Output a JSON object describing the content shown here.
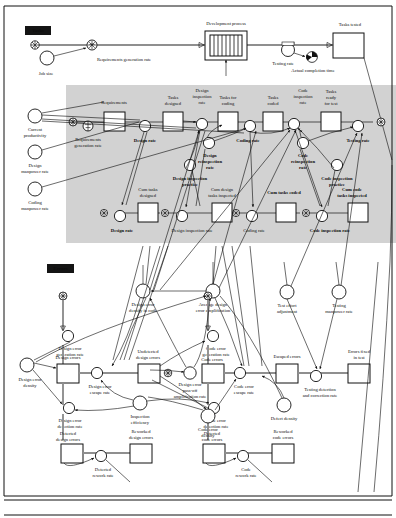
{
  "diagram": {
    "type": "system-dynamics-stock-and-flow",
    "bands": [
      {
        "id": "tasks",
        "label": "Tasks"
      },
      {
        "id": "errors",
        "label": "Errors"
      }
    ],
    "tasks_band": {
      "overview": {
        "stocks": [
          {
            "name": "Development process",
            "x": 225,
            "y": 46,
            "kind": "conveyor"
          },
          {
            "name": "Tasks tested",
            "x": 352,
            "y": 46,
            "kind": "stock"
          }
        ],
        "rates": [
          {
            "name": "Requirements generation rate",
            "x": 92,
            "y": 45,
            "kind": "valve"
          },
          {
            "name": "Testing rate",
            "x": 288,
            "y": 46,
            "kind": "valve"
          }
        ],
        "auxiliaries": [
          {
            "name": "Job size",
            "x": 47,
            "y": 58
          },
          {
            "name": "Actual completion time",
            "x": 312,
            "y": 58,
            "kind": "badge"
          }
        ],
        "clouds": [
          {
            "x": 35,
            "y": 45
          }
        ]
      },
      "detail": {
        "stocks": [
          {
            "name": "Requirements",
            "x": 115,
            "y": 122
          },
          {
            "name": "Tasks designed",
            "x": 173,
            "y": 122
          },
          {
            "name": "Tasks for coding",
            "x": 228,
            "y": 122
          },
          {
            "name": "Tasks coded",
            "x": 273,
            "y": 122
          },
          {
            "name": "Tasks ready for test",
            "x": 331,
            "y": 122
          },
          {
            "name": "Cum tasks designed",
            "x": 142,
            "y": 213
          },
          {
            "name": "Cum design tasks inspected",
            "x": 226,
            "y": 213
          },
          {
            "name": "Cum tasks coded",
            "x": 290,
            "y": 213
          },
          {
            "name": "Cum code tasks inspected",
            "x": 355,
            "y": 213
          }
        ],
        "rates": [
          {
            "name": "Requirements generation rate",
            "x": 84,
            "y": 126
          },
          {
            "name": "Design rate",
            "x": 145,
            "y": 126
          },
          {
            "name": "Design inspection rate",
            "x": 202,
            "y": 126
          },
          {
            "name": "Coding rate",
            "x": 250,
            "y": 126
          },
          {
            "name": "Code inspection rate",
            "x": 303,
            "y": 126
          },
          {
            "name": "Testing rate",
            "x": 358,
            "y": 126
          },
          {
            "name": "Design rate",
            "x": 118,
            "y": 213
          },
          {
            "name": "Design inspection rate",
            "x": 190,
            "y": 213
          },
          {
            "name": "Coding rate",
            "x": 258,
            "y": 213
          },
          {
            "name": "Code inspection rate",
            "x": 330,
            "y": 213
          }
        ],
        "auxiliaries": [
          {
            "name": "Current productivity",
            "x": 35,
            "y": 120
          },
          {
            "name": "Design manpower rate",
            "x": 35,
            "y": 155
          },
          {
            "name": "Coding manpower rate",
            "x": 35,
            "y": 192
          },
          {
            "name": "Design reinspection rate",
            "x": 209,
            "y": 148
          },
          {
            "name": "Design inspection practice",
            "x": 190,
            "y": 172
          },
          {
            "name": "Code reinspection rate",
            "x": 293,
            "y": 150
          },
          {
            "name": "Code inspection practice",
            "x": 337,
            "y": 172
          }
        ]
      }
    },
    "errors_band": {
      "stocks": [
        {
          "name": "Design errors",
          "x": 85,
          "y": 373
        },
        {
          "name": "Undetected design errors",
          "x": 150,
          "y": 373
        },
        {
          "name": "Detected design errors",
          "x": 118,
          "y": 447
        },
        {
          "name": "Reworked design errors",
          "x": 166,
          "y": 447
        },
        {
          "name": "Code errors",
          "x": 216,
          "y": 373
        },
        {
          "name": "Detected code errors",
          "x": 245,
          "y": 447
        },
        {
          "name": "Reworked code errors",
          "x": 295,
          "y": 447
        },
        {
          "name": "Escaped errors",
          "x": 286,
          "y": 373
        },
        {
          "name": "Errors fixed in test",
          "x": 358,
          "y": 373
        }
      ],
      "rates": [
        {
          "name": "Design error generation rate",
          "x": 92,
          "y": 338
        },
        {
          "name": "Code error generation rate",
          "x": 224,
          "y": 338
        },
        {
          "name": "Design error escape rate",
          "x": 118,
          "y": 373
        },
        {
          "name": "Design error detection rate",
          "x": 88,
          "y": 412
        },
        {
          "name": "Code error escape rate",
          "x": 256,
          "y": 373
        },
        {
          "name": "Code error detection rate",
          "x": 222,
          "y": 412
        },
        {
          "name": "Testing detection and correction rate",
          "x": 322,
          "y": 373
        },
        {
          "name": "Detected rework rate",
          "x": 142,
          "y": 465
        },
        {
          "name": "Code rework rate",
          "x": 269,
          "y": 465
        }
      ],
      "auxiliaries": [
        {
          "name": "Design error density in code",
          "x": 146,
          "y": 295
        },
        {
          "name": "Average design error amplification",
          "x": 216,
          "y": 295
        },
        {
          "name": "Test effort adjustment",
          "x": 288,
          "y": 300
        },
        {
          "name": "Testing manpower rate",
          "x": 340,
          "y": 300
        },
        {
          "name": "Design error density",
          "x": 30,
          "y": 365
        },
        {
          "name": "Inspection efficiency",
          "x": 152,
          "y": 410
        },
        {
          "name": "Design error pass-off amplification rate",
          "x": 196,
          "y": 390
        },
        {
          "name": "Code error density",
          "x": 212,
          "y": 418
        },
        {
          "name": "Defect density",
          "x": 286,
          "y": 412
        }
      ],
      "clouds": [
        {
          "x": 63,
          "y": 322
        },
        {
          "x": 208,
          "y": 322
        },
        {
          "x": 192,
          "y": 373
        },
        {
          "x": 117,
          "y": 213
        },
        {
          "x": 165,
          "y": 213
        },
        {
          "x": 236,
          "y": 213
        },
        {
          "x": 306,
          "y": 213
        }
      ]
    }
  }
}
